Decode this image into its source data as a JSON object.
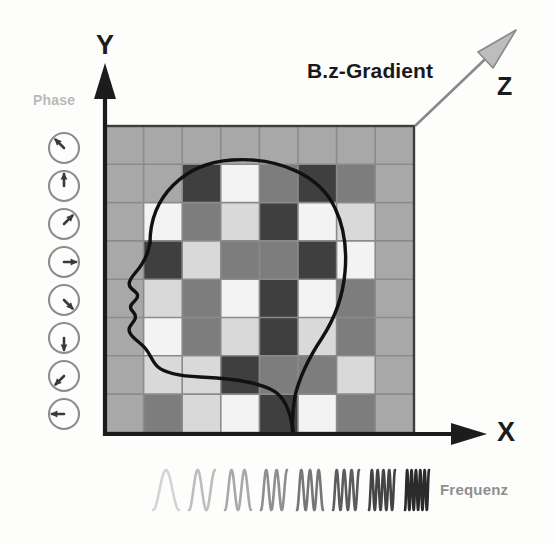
{
  "figure": {
    "title_text": "MRI k-space encoding schematic",
    "background": "#fdfdfc"
  },
  "axes": {
    "y_label": "Y",
    "x_label": "X",
    "z_label": "Z",
    "y_axis_name": "y-axis-arrow",
    "x_axis_name": "x-axis-arrow",
    "axis_color": "#1c1c1c"
  },
  "gradient": {
    "label": "B.z-Gradient",
    "arrow_color": "#8a8a8a",
    "arrow_head_fill": "#bdbdbd",
    "start": [
      415,
      126
    ],
    "end": [
      512,
      33
    ]
  },
  "phase": {
    "label": "Phase",
    "label_color": "#b9b9b9",
    "clock_color": "#8d8d8d",
    "needle_color": "#3a3a3a",
    "clocks": [
      {
        "name": "phase-clock-1",
        "angle_deg": 315,
        "cy": 148
      },
      {
        "name": "phase-clock-2",
        "angle_deg": 0,
        "cy": 186
      },
      {
        "name": "phase-clock-3",
        "angle_deg": 45,
        "cy": 224
      },
      {
        "name": "phase-clock-4",
        "angle_deg": 90,
        "cy": 262
      },
      {
        "name": "phase-clock-5",
        "angle_deg": 135,
        "cy": 300
      },
      {
        "name": "phase-clock-6",
        "angle_deg": 180,
        "cy": 338
      },
      {
        "name": "phase-clock-7",
        "angle_deg": 225,
        "cy": 376
      },
      {
        "name": "phase-clock-8",
        "angle_deg": 270,
        "cy": 414
      }
    ],
    "clock_cx": 64,
    "clock_r": 15
  },
  "frequency": {
    "label": "Frequenz",
    "label_color": "#8f8f8f",
    "waves": [
      {
        "name": "freq-wave-1",
        "cycles": 1,
        "color": "#d4d4d4",
        "x": 153,
        "width": 26
      },
      {
        "name": "freq-wave-2",
        "cycles": 1.5,
        "color": "#bdbdbd",
        "x": 189,
        "width": 26
      },
      {
        "name": "freq-wave-3",
        "cycles": 2,
        "color": "#a8a8a8",
        "x": 225,
        "width": 26
      },
      {
        "name": "freq-wave-4",
        "cycles": 2.5,
        "color": "#8e8e8e",
        "x": 261,
        "width": 26
      },
      {
        "name": "freq-wave-5",
        "cycles": 3,
        "color": "#767676",
        "x": 297,
        "width": 26
      },
      {
        "name": "freq-wave-6",
        "cycles": 3.5,
        "color": "#5c5c5c",
        "x": 333,
        "width": 26
      },
      {
        "name": "freq-wave-7",
        "cycles": 4.5,
        "color": "#444444",
        "x": 369,
        "width": 26
      },
      {
        "name": "freq-wave-8",
        "cycles": 5.5,
        "color": "#2b2b2b",
        "x": 405,
        "width": 24
      }
    ]
  },
  "grid": {
    "name": "checkerboard-grid",
    "x": 105,
    "y": 126,
    "cols": 8,
    "rows": 8,
    "cell_w": 38.6,
    "cell_h": 38.3,
    "line_color": "#8b8b8b",
    "border_color": "#3d3d3d",
    "background": "#a8a8a8",
    "palette": {
      "bg": "#a8a8a8",
      "dark": "#3f3f3f",
      "mid": "#7d7d7d",
      "light": "#d9d9d9",
      "white": "#f3f3f3"
    },
    "cells": [
      [
        "bg",
        "bg",
        "bg",
        "bg",
        "bg",
        "bg",
        "bg",
        "bg"
      ],
      [
        "bg",
        "bg",
        "dark",
        "white",
        "mid",
        "dark",
        "mid",
        "bg"
      ],
      [
        "bg",
        "white",
        "mid",
        "light",
        "dark",
        "white",
        "light",
        "bg"
      ],
      [
        "bg",
        "dark",
        "light",
        "mid",
        "mid",
        "dark",
        "white",
        "bg"
      ],
      [
        "bg",
        "light",
        "mid",
        "white",
        "dark",
        "white",
        "mid",
        "bg"
      ],
      [
        "bg",
        "white",
        "mid",
        "light",
        "dark",
        "light",
        "mid",
        "bg"
      ],
      [
        "bg",
        "light",
        "light",
        "dark",
        "mid",
        "mid",
        "light",
        "bg"
      ],
      [
        "bg",
        "mid",
        "light",
        "white",
        "dark",
        "white",
        "mid",
        "bg"
      ]
    ]
  },
  "head": {
    "name": "head-profile-outline",
    "stroke_color": "#111111",
    "stroke_width": 3.2
  }
}
